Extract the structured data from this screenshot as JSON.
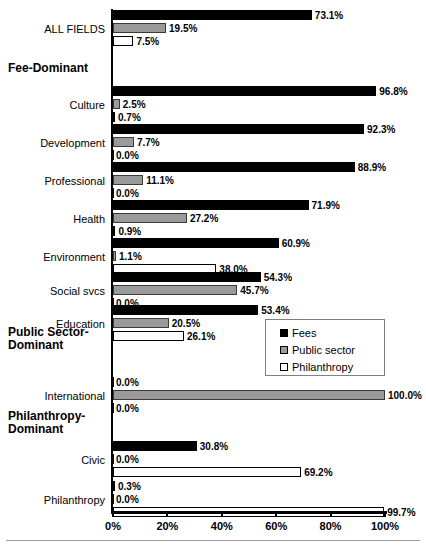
{
  "chart_data": {
    "type": "bar",
    "orientation": "horizontal",
    "title": "",
    "xlabel": "",
    "ylabel": "",
    "xlim": [
      0,
      100
    ],
    "xticks": [
      "0%",
      "20%",
      "40%",
      "60%",
      "80%",
      "100%"
    ],
    "xtick_values": [
      0,
      20,
      40,
      60,
      80,
      100
    ],
    "grid": false,
    "legend_position": "center-right",
    "series": [
      {
        "name": "Fees",
        "color": "#000000"
      },
      {
        "name": "Public sector",
        "color": "#9a9a9a"
      },
      {
        "name": "Philanthropy",
        "color": "#ffffff"
      }
    ],
    "categories": [
      "ALL FIELDS",
      "Culture",
      "Development",
      "Professional",
      "Health",
      "Environment",
      "Social svcs",
      "Education",
      "International",
      "Civic",
      "Philanthropy"
    ],
    "group_headings": [
      "Fee-Dominant",
      "Public Sector-Dominant",
      "Philanthropy-Dominant"
    ],
    "rows": [
      {
        "category": "ALL FIELDS",
        "fees": 73.1,
        "public": 19.5,
        "phil": 7.5,
        "fees_label": "73.1%",
        "public_label": "19.5%",
        "phil_label": "7.5%"
      },
      {
        "category": "Culture",
        "fees": 96.8,
        "public": 2.5,
        "phil": 0.7,
        "fees_label": "96.8%",
        "public_label": "2.5%",
        "phil_label": "0.7%"
      },
      {
        "category": "Development",
        "fees": 92.3,
        "public": 7.7,
        "phil": 0.0,
        "fees_label": "92.3%",
        "public_label": "7.7%",
        "phil_label": "0.0%"
      },
      {
        "category": "Professional",
        "fees": 88.9,
        "public": 11.1,
        "phil": 0.0,
        "fees_label": "88.9%",
        "public_label": "11.1%",
        "phil_label": "0.0%"
      },
      {
        "category": "Health",
        "fees": 71.9,
        "public": 27.2,
        "phil": 0.9,
        "fees_label": "71.9%",
        "public_label": "27.2%",
        "phil_label": "0.9%"
      },
      {
        "category": "Environment",
        "fees": 60.9,
        "public": 1.1,
        "phil": 38.0,
        "fees_label": "60.9%",
        "public_label": "1.1%",
        "phil_label": "38.0%"
      },
      {
        "category": "Social svcs",
        "fees": 54.3,
        "public": 45.7,
        "phil": 0.0,
        "fees_label": "54.3%",
        "public_label": "45.7%",
        "phil_label": "0.0%"
      },
      {
        "category": "Education",
        "fees": 53.4,
        "public": 20.5,
        "phil": 26.1,
        "fees_label": "53.4%",
        "public_label": "20.5%",
        "phil_label": "26.1%"
      },
      {
        "category": "International",
        "fees": 0.0,
        "public": 100.0,
        "phil": 0.0,
        "fees_label": "0.0%",
        "public_label": "100.0%",
        "phil_label": "0.0%"
      },
      {
        "category": "Civic",
        "fees": 30.8,
        "public": 0.0,
        "phil": 69.2,
        "fees_label": "30.8%",
        "public_label": "0.0%",
        "phil_label": "69.2%"
      },
      {
        "category": "Philanthropy",
        "fees": 0.3,
        "public": 0.0,
        "phil": 99.7,
        "fees_label": "0.3%",
        "public_label": "0.0%",
        "phil_label": "99.7%"
      }
    ]
  },
  "legend": {
    "items": [
      {
        "label": "Fees"
      },
      {
        "label": "Public sector"
      },
      {
        "label": "Philanthropy"
      }
    ]
  },
  "axis": {
    "ticks": [
      {
        "label": "0%"
      },
      {
        "label": "20%"
      },
      {
        "label": "40%"
      },
      {
        "label": "60%"
      },
      {
        "label": "80%"
      },
      {
        "label": "100%"
      }
    ]
  },
  "headings": {
    "fee_dominant": "Fee-Dominant",
    "public_sector_dominant_line1": "Public Sector-",
    "public_sector_dominant_line2": "Dominant",
    "philanthropy_dominant_line1": "Philanthropy-",
    "philanthropy_dominant_line2": "Dominant"
  }
}
